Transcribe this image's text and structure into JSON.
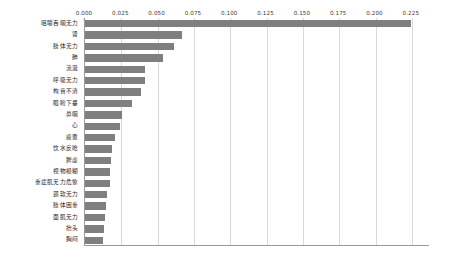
{
  "chart_data": {
    "type": "bar",
    "orientation": "horizontal",
    "title": "",
    "xlabel": "",
    "ylabel": "",
    "xlim": [
      0.0,
      0.2375
    ],
    "grid": true,
    "legend": false,
    "bar_color": "#7f7f7f",
    "axis_color": "#9a9a9a",
    "grid_color": "#d8d8d8",
    "xticks": [
      "0.000",
      "0.025",
      "0.050",
      "0.075",
      "0.100",
      "0.125",
      "0.150",
      "0.175",
      "0.200",
      "0.225"
    ],
    "xtick_values": [
      0.0,
      0.025,
      0.05,
      0.075,
      0.1,
      0.125,
      0.15,
      0.175,
      0.2,
      0.225
    ],
    "categories": [
      "咀嚼吞咽无力",
      "肾",
      "肢体无力",
      "肺",
      "流涎",
      "呼吸无力",
      "构音不清",
      "眼睑下垂",
      "鼻咽",
      "心",
      "疲惫",
      "饮水反呛",
      "脾虚",
      "视物模糊",
      "重症肌无力危象",
      "颈软无力",
      "肢体困重",
      "面肌无力",
      "抬头",
      "胸闷"
    ],
    "values": [
      0.2245,
      0.0665,
      0.0615,
      0.0535,
      0.0415,
      0.041,
      0.0385,
      0.0325,
      0.0255,
      0.024,
      0.0205,
      0.0185,
      0.018,
      0.0175,
      0.017,
      0.015,
      0.0145,
      0.014,
      0.013,
      0.0125
    ]
  }
}
